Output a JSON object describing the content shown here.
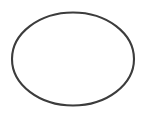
{
  "image": {
    "width": 157,
    "height": 115,
    "background_color": "#ffffff",
    "subject": "o-ring-seal-outline",
    "alt_text": "O-ring seal shown as a thin dark elliptical outline on a white background"
  },
  "shape": {
    "name": "o-ring-outline",
    "type": "ellipse",
    "center_x": 73,
    "center_y": 59,
    "radius_x": 61,
    "radius_y": 46.5,
    "stroke_color": "#3c3c3c",
    "stroke_width": 2.1,
    "fill_color": "#ffffff",
    "bounds": {
      "left": 11,
      "right": 135,
      "top": 12,
      "bottom": 106
    }
  }
}
